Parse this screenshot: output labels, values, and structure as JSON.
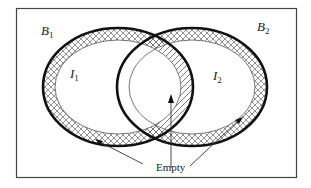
{
  "diagram": {
    "type": "venn-with-boundaries",
    "regions": {
      "b1": {
        "label": "B",
        "subscript": "1",
        "description": "outer boundary band of set 1"
      },
      "b2": {
        "label": "B",
        "subscript": "2",
        "description": "outer boundary band of set 2"
      },
      "i1": {
        "label": "I",
        "subscript": "1",
        "description": "interior of set 1"
      },
      "i2": {
        "label": "I",
        "subscript": "2",
        "description": "interior of set 2"
      }
    },
    "annotation": {
      "text": "Empty",
      "arrows": 3
    },
    "colors": {
      "stroke": "#111111",
      "frame": "#444444",
      "hatch": "#666666",
      "background": "#ffffff"
    }
  }
}
